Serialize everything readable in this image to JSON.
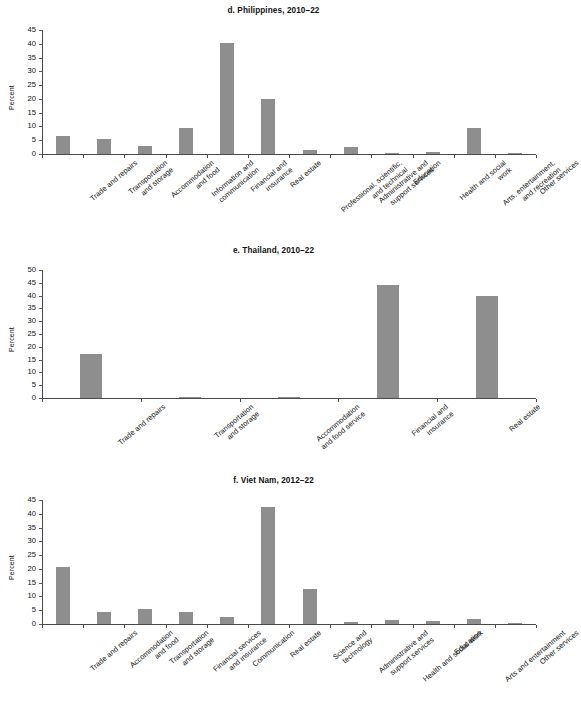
{
  "figure": {
    "ylabel": "Percent",
    "bar_color": "#8e8e8e",
    "axis_color": "#4a4a4a"
  },
  "panels": [
    {
      "id": "panel-d",
      "title": "d. Philippines, 2010–22",
      "ylabel": "Percent",
      "ylim": [
        0,
        45
      ],
      "yticks": [
        0,
        5,
        10,
        15,
        20,
        25,
        30,
        35,
        40,
        45
      ],
      "ytick_labels": [
        "0",
        "5",
        "10",
        "15",
        "20",
        "25",
        "30",
        "35",
        "40",
        "45"
      ]
    },
    {
      "id": "panel-e",
      "title": "e. Thailand, 2010–22",
      "ylabel": "Percent",
      "ylim": [
        0,
        50
      ],
      "yticks": [
        0,
        5,
        10,
        15,
        20,
        25,
        30,
        35,
        40,
        45,
        50
      ],
      "ytick_labels": [
        "0",
        "5",
        "10",
        "15",
        "20",
        "25",
        "30",
        "35",
        "40",
        "45",
        "50"
      ]
    },
    {
      "id": "panel-f",
      "title": "f. Viet Nam, 2012–22",
      "ylabel": "Percent",
      "ylim": [
        0,
        45
      ],
      "yticks": [
        0,
        5,
        10,
        15,
        20,
        25,
        30,
        35,
        40,
        45
      ],
      "ytick_labels": [
        "0",
        "5",
        "10",
        "15",
        "20",
        "25",
        "30",
        "35",
        "40",
        "45"
      ]
    }
  ],
  "chart_data": [
    {
      "type": "bar",
      "title": "d. Philippines, 2010–22",
      "xlabel": "",
      "ylabel": "Percent",
      "ylim": [
        0,
        45
      ],
      "yticks": [
        0,
        5,
        10,
        15,
        20,
        25,
        30,
        35,
        40,
        45
      ],
      "grid": false,
      "legend": "none",
      "categories": [
        "Trade and repairs",
        "Transportation\nand storage",
        "Accommodation\nand food",
        "Information and\ncommunication",
        "Financial and\ninsurance",
        "Real estate",
        "Professional, scientific,\nand technical",
        "Administrative and\nsupport services",
        "Education",
        "Health and social\nwork",
        "Arts, entertainment,\nand recreation",
        "Other services"
      ],
      "values": [
        6.6,
        5.3,
        3.0,
        9.5,
        40.2,
        19.8,
        1.6,
        2.7,
        0.1,
        0.8,
        9.4,
        0.05
      ]
    },
    {
      "type": "bar",
      "title": "e. Thailand, 2010–22",
      "xlabel": "",
      "ylabel": "Percent",
      "ylim": [
        0,
        50
      ],
      "yticks": [
        0,
        5,
        10,
        15,
        20,
        25,
        30,
        35,
        40,
        45,
        50
      ],
      "grid": false,
      "legend": "none",
      "categories": [
        "Trade and repairs",
        "Transportation\nand storage",
        "Accommodation\nand food service",
        "Financial and\ninsurance",
        "Real estate"
      ],
      "values": [
        17.1,
        0.0,
        0.2,
        44.2,
        39.8
      ]
    },
    {
      "type": "bar",
      "title": "f. Viet Nam, 2012–22",
      "xlabel": "",
      "ylabel": "Percent",
      "ylim": [
        0,
        45
      ],
      "yticks": [
        0,
        5,
        10,
        15,
        20,
        25,
        30,
        35,
        40,
        45
      ],
      "grid": false,
      "legend": "none",
      "categories": [
        "Trade and repairs",
        "Accommodation\nand food",
        "Transportation\nand storage",
        "Financial services\nand insurance",
        "Communication",
        "Real estate",
        "Science and\ntechnology",
        "Administrative and\nsupport services",
        "Health and social work",
        "Education",
        "Arts and entertainment",
        "Other services"
      ],
      "values": [
        20.6,
        4.2,
        5.4,
        4.5,
        2.7,
        42.4,
        12.7,
        0.8,
        1.6,
        1.0,
        1.8,
        0.2
      ]
    }
  ]
}
